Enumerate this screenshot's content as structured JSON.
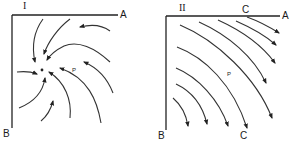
{
  "figure": {
    "panels": [
      {
        "id": "I",
        "numeral": "I",
        "axis_top_label": "A",
        "axis_left_label": "B",
        "point_label": "P",
        "pattern": "spiral sink — flow lines converge on a central point"
      },
      {
        "id": "II",
        "numeral": "II",
        "axis_top_label": "A",
        "axis_left_label": "B",
        "curve_label_top": "C",
        "curve_label_bottom": "C",
        "point_label": "P",
        "pattern": "parallel curved flow lines running from upper-left to lower-right"
      }
    ]
  }
}
